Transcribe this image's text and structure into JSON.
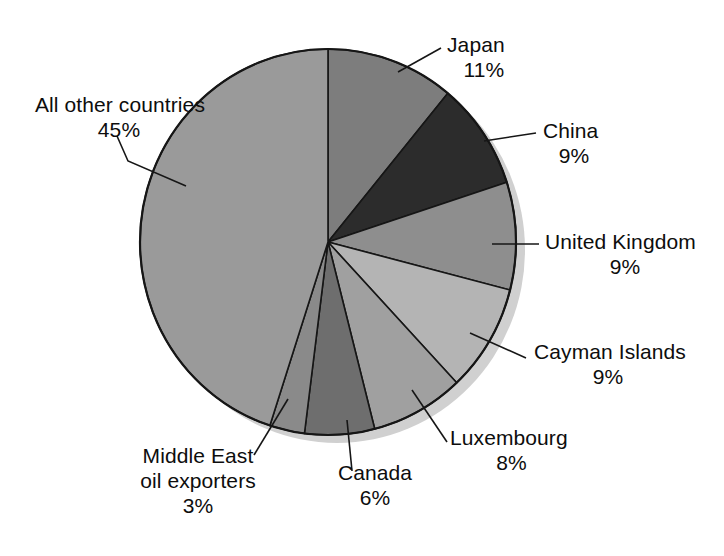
{
  "chart_data": {
    "type": "pie",
    "title": "",
    "subtitle": "",
    "xlabel": "",
    "ylabel": "",
    "legend_position": "none",
    "grid": false,
    "units": "percent",
    "start_angle_deg": 0,
    "direction": "clockwise",
    "categories": [
      "Japan",
      "China",
      "United Kingdom",
      "Cayman Islands",
      "Luxembourg",
      "Canada",
      "Middle East oil exporters",
      "All other countries"
    ],
    "values": [
      11,
      9,
      9,
      9,
      8,
      6,
      3,
      45
    ],
    "value_labels": [
      "11%",
      "9%",
      "9%",
      "9%",
      "8%",
      "6%",
      "3%",
      "45%"
    ],
    "colors": [
      "#7d7d7d",
      "#2c2c2c",
      "#8e8e8e",
      "#b4b4b4",
      "#a0a0a0",
      "#6e6e6e",
      "#8a8a8a",
      "#9a9a9a"
    ],
    "slices": [
      {
        "name": "Japan",
        "value": 11,
        "pct": "11%",
        "color": "#7d7d7d"
      },
      {
        "name": "China",
        "value": 9,
        "pct": "9%",
        "color": "#2c2c2c"
      },
      {
        "name": "United Kingdom",
        "value": 9,
        "pct": "9%",
        "color": "#8e8e8e"
      },
      {
        "name": "Cayman Islands",
        "value": 9,
        "pct": "9%",
        "color": "#b4b4b4"
      },
      {
        "name": "Luxembourg",
        "value": 8,
        "pct": "8%",
        "color": "#a0a0a0"
      },
      {
        "name": "Canada",
        "value": 6,
        "pct": "6%",
        "color": "#6e6e6e"
      },
      {
        "name": "Middle East oil exporters",
        "value": 3,
        "pct": "3%",
        "color": "#8a8a8a"
      },
      {
        "name": "All other countries",
        "value": 45,
        "pct": "45%",
        "color": "#9a9a9a"
      }
    ]
  },
  "labels": {
    "japan": {
      "name": "Japan",
      "pct": "11%"
    },
    "china": {
      "name": "China",
      "pct": "9%"
    },
    "uk": {
      "name": "United Kingdom",
      "pct": "9%"
    },
    "cayman": {
      "name": "Cayman Islands",
      "pct": "9%"
    },
    "luxembourg": {
      "name": "Luxembourg",
      "pct": "8%"
    },
    "canada": {
      "name": "Canada",
      "pct": "6%"
    },
    "middle_east": {
      "name_line1": "Middle East",
      "name_line2": "oil exporters",
      "pct": "3%"
    },
    "all_other": {
      "name": "All other countries",
      "pct": "45%"
    }
  },
  "style": {
    "outline_color": "#161616",
    "shadow_color": "#cfcfcf",
    "text_color": "#0d0d0d",
    "background": "#ffffff"
  }
}
